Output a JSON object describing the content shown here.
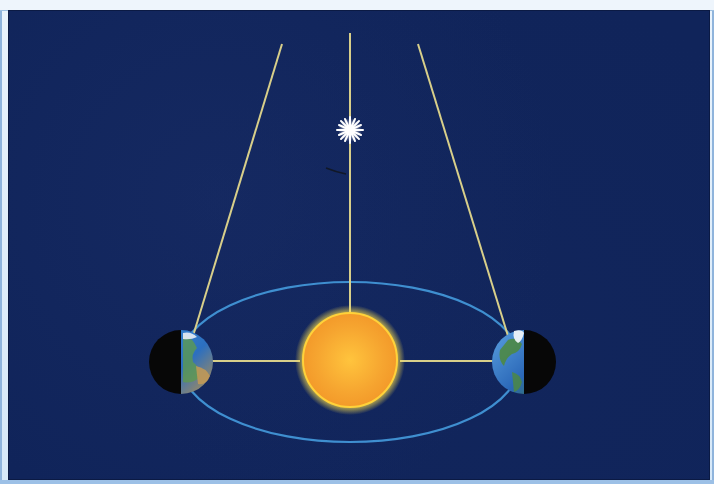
{
  "diagram": {
    "colors": {
      "background": "#10245a",
      "frame": "#cfe3f5",
      "sight_lines": "#d8cf8a",
      "orbit": "#3f8fd0",
      "sun": "#f5a623",
      "sun_glow": "#ffe14a",
      "star": "#ffffff",
      "earth_night": "#0a0a0a"
    },
    "elements": {
      "star": {
        "label": "Nearby star",
        "cx": 350,
        "cy": 130
      },
      "sun": {
        "label": "Sun",
        "cx": 350,
        "cy": 360,
        "r": 48
      },
      "earth_left": {
        "label": "Earth (position 1)",
        "cx": 181,
        "cy": 362,
        "r": 32,
        "night_side": "left"
      },
      "earth_right": {
        "label": "Earth (position 2)",
        "cx": 524,
        "cy": 362,
        "r": 32,
        "night_side": "right"
      },
      "orbit": {
        "label": "Earth's orbit",
        "cx": 350,
        "cy": 362,
        "rx": 170,
        "ry": 80
      },
      "parallax_angle_marker": {
        "label": "parallax angle",
        "x": 330,
        "y": 170
      }
    }
  }
}
